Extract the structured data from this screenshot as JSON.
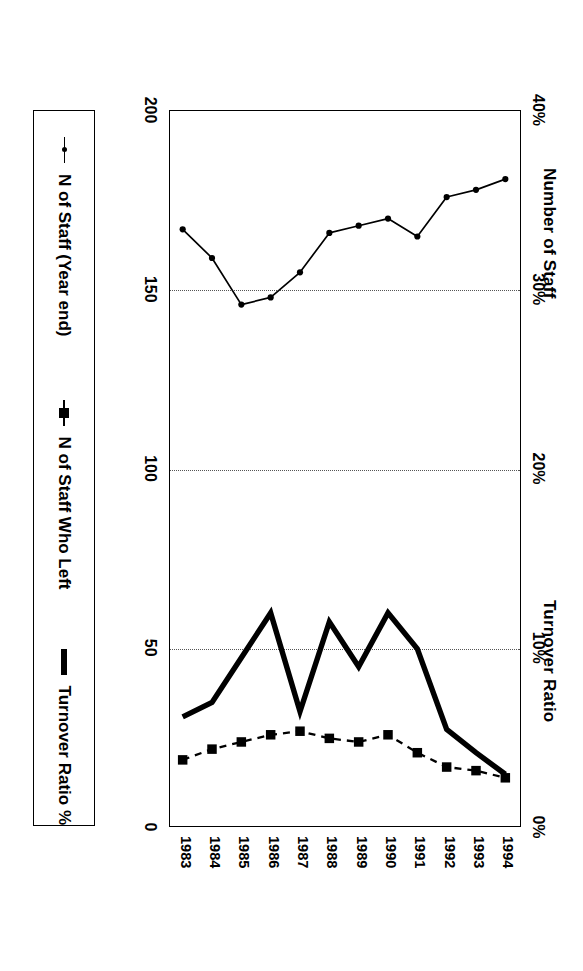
{
  "titles": {
    "left": "Number of Staff",
    "right": "Turnover Ratio"
  },
  "axes": {
    "staff_ticks": [
      "0",
      "50",
      "100",
      "150",
      "200"
    ],
    "pct_ticks": [
      "0%",
      "10%",
      "20%",
      "30%",
      "40%"
    ],
    "years": [
      "1983",
      "1984",
      "1985",
      "1986",
      "1987",
      "1988",
      "1989",
      "1990",
      "1991",
      "1992",
      "1993",
      "1994"
    ]
  },
  "legend": {
    "items": [
      {
        "label": "N of Staff (Year end)",
        "key": "thin-dot-line-marker"
      },
      {
        "label": "N of Staff Who Left",
        "key": "dashed-square-marker"
      },
      {
        "label": "Turnover Ratio %",
        "key": "bold-solid-line-marker"
      }
    ]
  },
  "chart_data": {
    "type": "line",
    "xlabel": "",
    "ylabel": "Number of Staff",
    "y2label": "Turnover Ratio",
    "orientation": "rotated-90-clockwise",
    "grid": true,
    "legend_position": "bottom",
    "x": [
      "1983",
      "1984",
      "1985",
      "1986",
      "1987",
      "1988",
      "1989",
      "1990",
      "1991",
      "1992",
      "1993",
      "1994"
    ],
    "ylim": [
      0,
      200
    ],
    "y2lim": [
      0,
      40
    ],
    "yticks": [
      0,
      50,
      100,
      150,
      200
    ],
    "y2ticks": [
      0,
      10,
      20,
      30,
      40
    ],
    "series": [
      {
        "name": "N of Staff (Year end)",
        "axis": "left",
        "unit": "staff",
        "style": "thin-solid-with-dots",
        "values": [
          167,
          159,
          146,
          148,
          155,
          166,
          168,
          170,
          165,
          176,
          178,
          181
        ]
      },
      {
        "name": "N of Staff Who Left",
        "axis": "left",
        "unit": "staff",
        "style": "dashed-with-squares",
        "values": [
          19,
          22,
          24,
          26,
          27,
          25,
          24,
          26,
          21,
          17,
          16,
          14
        ]
      },
      {
        "name": "Turnover Ratio %",
        "axis": "right",
        "unit": "percent",
        "style": "bold-solid",
        "values": [
          6.2,
          7.0,
          9.5,
          12.0,
          6.5,
          11.5,
          9.0,
          12.0,
          10.0,
          5.5,
          4.2,
          3.0
        ]
      }
    ]
  }
}
